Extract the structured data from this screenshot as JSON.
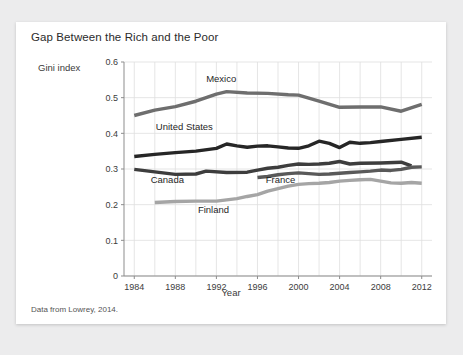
{
  "figure": {
    "title": "Gap Between the Rich and the Poor",
    "source_note": "Data from Lowrey, 2014."
  },
  "chart_data": {
    "type": "line",
    "title": "Gap Between the Rich and the Poor",
    "xlabel": "Year",
    "ylabel": "Gini index",
    "xlim": [
      1983,
      2013
    ],
    "ylim": [
      0,
      0.6
    ],
    "grid": true,
    "legend_position": "inline-labels",
    "x_ticks": [
      1984,
      1988,
      1992,
      1996,
      2000,
      2004,
      2008,
      2012
    ],
    "x_tick_labels": [
      "1984",
      "1988",
      "1992",
      "1996",
      "2000",
      "2004",
      "2008",
      "2012"
    ],
    "y_ticks": [
      0,
      0.1,
      0.2,
      0.3,
      0.4,
      0.5,
      0.6
    ],
    "y_tick_labels": [
      "0",
      "0.1",
      "0.2",
      "0.3",
      "0.4",
      "0.5",
      "0.6"
    ],
    "series": [
      {
        "name": "Mexico",
        "color": "#6e6e6e",
        "label_x": 1991,
        "label_y": 0.545,
        "x": [
          1984,
          1986,
          1988,
          1990,
          1992,
          1993,
          1995,
          1997,
          1999,
          2000,
          2002,
          2004,
          2006,
          2008,
          2010,
          2012
        ],
        "values": [
          0.45,
          0.465,
          0.475,
          0.49,
          0.51,
          0.517,
          0.513,
          0.512,
          0.508,
          0.507,
          0.49,
          0.473,
          0.474,
          0.474,
          0.462,
          0.481
        ]
      },
      {
        "name": "United States",
        "color": "#262626",
        "label_x": 1986.1,
        "label_y": 0.41,
        "x": [
          1984,
          1986,
          1988,
          1990,
          1992,
          1993,
          1994,
          1995,
          1996,
          1997,
          1998,
          1999,
          2000,
          2001,
          2002,
          2003,
          2004,
          2005,
          2006,
          2007,
          2008,
          2010,
          2012
        ],
        "values": [
          0.335,
          0.341,
          0.346,
          0.35,
          0.358,
          0.37,
          0.365,
          0.361,
          0.364,
          0.365,
          0.362,
          0.359,
          0.358,
          0.365,
          0.378,
          0.372,
          0.36,
          0.375,
          0.372,
          0.374,
          0.377,
          0.383,
          0.389
        ]
      },
      {
        "name": "Canada",
        "color": "#3d3d3d",
        "label_x": 1985.6,
        "label_y": 0.262,
        "x": [
          1984,
          1986,
          1988,
          1990,
          1991,
          1993,
          1995,
          1996,
          1997,
          1998,
          1999,
          2000,
          2001,
          2002,
          2003,
          2004,
          2005,
          2006,
          2008,
          2010,
          2011
        ],
        "values": [
          0.299,
          0.292,
          0.285,
          0.286,
          0.294,
          0.29,
          0.291,
          0.297,
          0.302,
          0.305,
          0.31,
          0.314,
          0.313,
          0.314,
          0.316,
          0.321,
          0.314,
          0.316,
          0.317,
          0.319,
          0.309
        ]
      },
      {
        "name": "France",
        "color": "#595959",
        "label_x": 1996.8,
        "label_y": 0.262,
        "x": [
          1996,
          1997,
          1998,
          1999,
          2000,
          2001,
          2002,
          2003,
          2004,
          2005,
          2006,
          2007,
          2008,
          2009,
          2010,
          2011,
          2012
        ],
        "values": [
          0.276,
          0.279,
          0.284,
          0.287,
          0.289,
          0.287,
          0.285,
          0.286,
          0.288,
          0.29,
          0.292,
          0.294,
          0.297,
          0.296,
          0.299,
          0.305,
          0.306
        ]
      },
      {
        "name": "Finland",
        "color": "#a5a5a5",
        "label_x": 1990.2,
        "label_y": 0.177,
        "x": [
          1986,
          1988,
          1990,
          1992,
          1994,
          1995,
          1996,
          1997,
          1998,
          1999,
          2000,
          2001,
          2002,
          2003,
          2004,
          2005,
          2006,
          2007,
          2008,
          2009,
          2010,
          2011,
          2012
        ],
        "values": [
          0.206,
          0.209,
          0.21,
          0.21,
          0.217,
          0.223,
          0.228,
          0.238,
          0.245,
          0.252,
          0.257,
          0.259,
          0.26,
          0.262,
          0.266,
          0.268,
          0.27,
          0.271,
          0.266,
          0.261,
          0.26,
          0.262,
          0.26
        ]
      }
    ]
  }
}
